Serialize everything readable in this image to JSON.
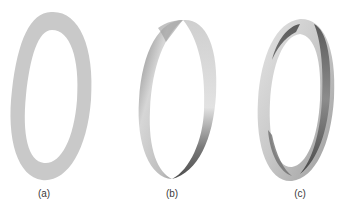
{
  "figure": {
    "panels": [
      {
        "id": "a",
        "label": "(a)",
        "description": "flat annulus ring",
        "shade": "#c9c9c9"
      },
      {
        "id": "b",
        "label": "(b)",
        "description": "ring band with one twist",
        "shade_light": "#d8d8d8",
        "shade_dark": "#6e6e6e"
      },
      {
        "id": "c",
        "label": "(c)",
        "description": "ring band with two-tone twisted surface",
        "shade_light": "#dedede",
        "shade_mid": "#b4b4b4",
        "shade_dark": "#5a5a5a"
      }
    ]
  }
}
